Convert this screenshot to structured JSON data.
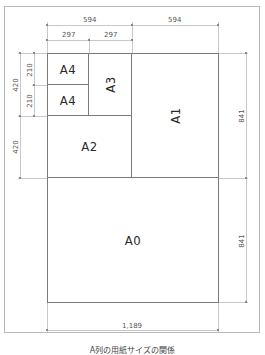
{
  "diagram": {
    "boxes": [
      {
        "id": "a4-top",
        "label": "A4"
      },
      {
        "id": "a4-bottom",
        "label": "A4"
      },
      {
        "id": "a3",
        "label": "A3"
      },
      {
        "id": "a2",
        "label": "A2"
      },
      {
        "id": "a1",
        "label": "A1"
      },
      {
        "id": "a0",
        "label": "A0"
      }
    ],
    "dimensions": {
      "top_left_594": "594",
      "top_right_594": "594",
      "top_297_a": "297",
      "top_297_b": "297",
      "left_420_outer": "420",
      "left_210_top": "210",
      "left_210_bottom": "210",
      "left_420_lower": "420",
      "right_841_upper": "841",
      "right_841_lower": "841",
      "bottom_1189": "1,189"
    },
    "caption": "A列の用紙サイズの関係"
  }
}
